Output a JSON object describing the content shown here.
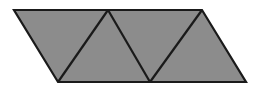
{
  "figure": {
    "name": "parallelogram-divided-into-triangles",
    "canvas": {
      "width": 256,
      "height": 92
    },
    "background_color": "#ffffff",
    "fill_color": "#8c8c8c",
    "stroke_color": "#1a1a1a",
    "stroke_width": 2.2,
    "outline": {
      "label": "parallelogram-outline",
      "points": "14,10 202,10 246,82 58,82"
    },
    "internal_lines": [
      {
        "label": "edge-bottom-left-to-top-apex-1",
        "x1": 58,
        "y1": 82,
        "x2": 108,
        "y2": 10
      },
      {
        "label": "edge-top-apex-1-to-bottom-notch",
        "x1": 108,
        "y1": 10,
        "x2": 150,
        "y2": 82
      },
      {
        "label": "edge-bottom-notch-to-top-right",
        "x1": 150,
        "y1": 82,
        "x2": 202,
        "y2": 10
      }
    ],
    "triangles": [
      {
        "label": "triangle-1-left",
        "points": "14,10 108,10 58,82"
      },
      {
        "label": "triangle-2-upright",
        "points": "58,82 108,10 150,82"
      },
      {
        "label": "triangle-3-inverted",
        "points": "108,10 202,10 150,82"
      },
      {
        "label": "triangle-4-right",
        "points": "150,82 202,10 246,82"
      }
    ],
    "vertices": [
      {
        "label": "vertex-top-left",
        "x": 14,
        "y": 10
      },
      {
        "label": "vertex-top-apex-1",
        "x": 108,
        "y": 10
      },
      {
        "label": "vertex-top-right",
        "x": 202,
        "y": 10
      },
      {
        "label": "vertex-bottom-left",
        "x": 58,
        "y": 82
      },
      {
        "label": "vertex-bottom-notch",
        "x": 150,
        "y": 82
      },
      {
        "label": "vertex-bottom-right",
        "x": 246,
        "y": 82
      }
    ]
  }
}
